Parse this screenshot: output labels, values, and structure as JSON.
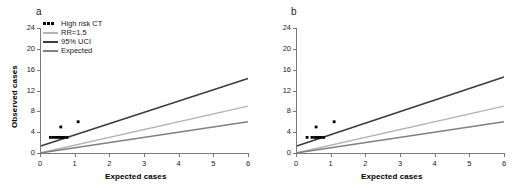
{
  "figure": {
    "panels": [
      {
        "letter": "a",
        "show_y_title": true,
        "show_legend": true
      },
      {
        "letter": "b",
        "show_y_title": false,
        "show_legend": false
      }
    ]
  },
  "legend": {
    "items": [
      {
        "label": "High risk CT",
        "key": "markers",
        "color": "#000000"
      },
      {
        "label": "RR=1.5",
        "key": "line",
        "color": "#b4b4b4"
      },
      {
        "label": "95% UCI",
        "key": "line",
        "color": "#3c3c3c"
      },
      {
        "label": "Expected",
        "key": "line",
        "color": "#808080"
      }
    ]
  },
  "chart_data": [
    {
      "type": "scatter",
      "panel": "a",
      "title": "a",
      "xlabel": "Expected cases",
      "ylabel": "Observed cases",
      "xlim": [
        0,
        6
      ],
      "ylim": [
        0,
        24
      ],
      "xticks": [
        0,
        1,
        2,
        3,
        4,
        5,
        6
      ],
      "yticks": [
        0,
        4,
        8,
        12,
        16,
        20,
        24
      ],
      "xtick_labels": [
        "0",
        "1",
        "2",
        "3",
        "4",
        "5",
        "6"
      ],
      "ytick_labels": [
        "0",
        "4",
        "8",
        "12",
        "16",
        "20",
        "24"
      ],
      "grid": false,
      "legend_position": "upper-left",
      "series": [
        {
          "name": "High risk CT",
          "type": "scatter",
          "marker": "square",
          "color": "#000000",
          "points": [
            [
              0.3,
              3.0
            ],
            [
              0.38,
              3.0
            ],
            [
              0.45,
              3.0
            ],
            [
              0.52,
              3.0
            ],
            [
              0.58,
              3.0
            ],
            [
              0.64,
              3.0
            ],
            [
              0.7,
              3.0
            ],
            [
              0.78,
              3.0
            ],
            [
              0.6,
              5.0
            ],
            [
              1.1,
              6.0
            ]
          ]
        },
        {
          "name": "95% UCI",
          "type": "line",
          "color": "#3c3c3c",
          "x": [
            0,
            6
          ],
          "y": [
            1.3,
            14.3
          ]
        },
        {
          "name": "RR=1.5",
          "type": "line",
          "color": "#b4b4b4",
          "x": [
            0,
            6
          ],
          "y": [
            0,
            9.0
          ]
        },
        {
          "name": "Expected",
          "type": "line",
          "color": "#808080",
          "x": [
            0,
            6
          ],
          "y": [
            0,
            6.0
          ]
        }
      ]
    },
    {
      "type": "scatter",
      "panel": "b",
      "title": "b",
      "xlabel": "Expected cases",
      "ylabel": "",
      "xlim": [
        0,
        6
      ],
      "ylim": [
        0,
        24
      ],
      "xticks": [
        0,
        1,
        2,
        3,
        4,
        5,
        6
      ],
      "yticks": [
        0,
        4,
        8,
        12,
        16,
        20,
        24
      ],
      "xtick_labels": [
        "0",
        "1",
        "2",
        "3",
        "4",
        "5",
        "6"
      ],
      "ytick_labels": [
        "0",
        "4",
        "8",
        "12",
        "16",
        "20",
        "24"
      ],
      "grid": false,
      "legend_position": "none",
      "series": [
        {
          "name": "High risk CT",
          "type": "scatter",
          "marker": "square",
          "color": "#000000",
          "points": [
            [
              0.32,
              3.0
            ],
            [
              0.46,
              3.0
            ],
            [
              0.54,
              3.0
            ],
            [
              0.6,
              3.0
            ],
            [
              0.66,
              3.0
            ],
            [
              0.72,
              3.0
            ],
            [
              0.8,
              3.0
            ],
            [
              0.58,
              5.0
            ],
            [
              1.1,
              6.0
            ]
          ]
        },
        {
          "name": "95% UCI",
          "type": "line",
          "color": "#3c3c3c",
          "x": [
            0,
            6
          ],
          "y": [
            1.3,
            14.6
          ]
        },
        {
          "name": "RR=1.5",
          "type": "line",
          "color": "#b4b4b4",
          "x": [
            0,
            6
          ],
          "y": [
            0,
            9.0
          ]
        },
        {
          "name": "Expected",
          "type": "line",
          "color": "#808080",
          "x": [
            0,
            6
          ],
          "y": [
            0,
            6.0
          ]
        }
      ]
    }
  ]
}
